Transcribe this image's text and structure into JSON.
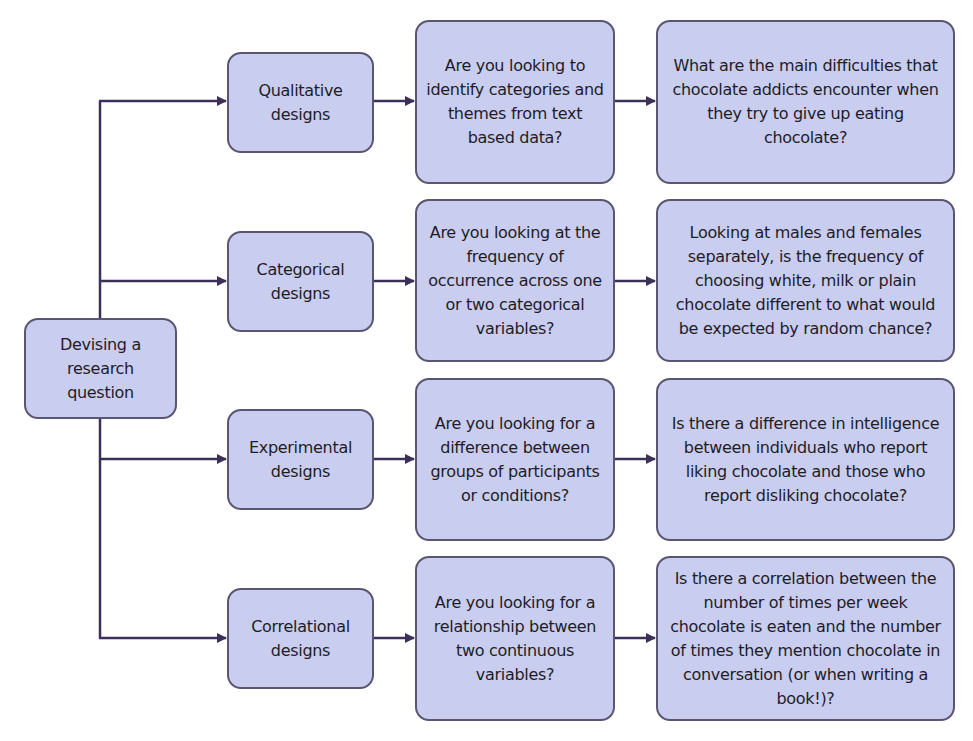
{
  "diagram": {
    "root": {
      "label": "Devising a research question"
    },
    "rows": [
      {
        "design": "Qualitative designs",
        "question": "Are you looking to identify categories and themes from text based data?",
        "example": "What are the main difficulties that chocolate addicts encounter when they try to give up eating chocolate?"
      },
      {
        "design": "Categorical designs",
        "question": "Are you looking at the frequency of occurrence across one or two categorical variables?",
        "example": "Looking at males and females separately, is the frequency of choosing white, milk or plain chocolate different to what would be expected by random chance?"
      },
      {
        "design": "Experimental designs",
        "question": "Are you looking for a difference between groups of participants or conditions?",
        "example": "Is there a difference in intelligence between individuals who report liking chocolate and those who report disliking chocolate?"
      },
      {
        "design": "Correlational designs",
        "question": "Are you looking for a relationship between two continuous variables?",
        "example": "Is there a correlation between the number of times per week chocolate is eaten and the number of times they mention chocolate in conversation (or when writing a book!)?"
      }
    ],
    "colors": {
      "box_fill": "#c9cdf0",
      "box_border": "#5a5570",
      "connector": "#3c3059",
      "text": "#1f1c26"
    }
  }
}
